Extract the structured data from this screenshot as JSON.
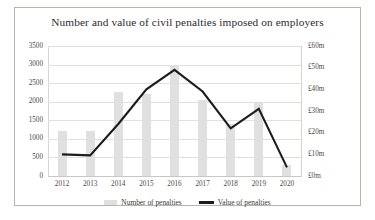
{
  "chart_data": {
    "type": "bar",
    "title": "Number and value of civil penalties imposed on employers",
    "categories": [
      "2012",
      "2013",
      "2014",
      "2015",
      "2016",
      "2017",
      "2018",
      "2019",
      "2020"
    ],
    "xlabel": "",
    "ylabel": "",
    "grid": true,
    "legend_position": "bottom",
    "series": [
      {
        "name": "Number of penalties",
        "type": "bar",
        "axis": "left",
        "color": "#e0e0e0",
        "values": [
          1200,
          1200,
          2250,
          2200,
          3000,
          2050,
          1400,
          2000,
          300
        ]
      },
      {
        "name": "Value of penalties",
        "type": "line",
        "axis": "right",
        "color": "#1c1c1c",
        "values": [
          10,
          9.5,
          24,
          40,
          49,
          39,
          22,
          31,
          4
        ]
      }
    ],
    "left_axis": {
      "ticks": [
        "0",
        "500",
        "1000",
        "1500",
        "2000",
        "2500",
        "3000",
        "3500"
      ],
      "min": 0,
      "max": 3500
    },
    "right_axis": {
      "ticks": [
        "£0m",
        "£10m",
        "£20m",
        "£30m",
        "£40m",
        "£50m",
        "£60m"
      ],
      "min": 0,
      "max": 60
    }
  },
  "legend": {
    "items": [
      {
        "label": "Number of penalties",
        "icon": "bar-swatch"
      },
      {
        "label": "Value of penalties",
        "icon": "line-swatch"
      }
    ]
  }
}
